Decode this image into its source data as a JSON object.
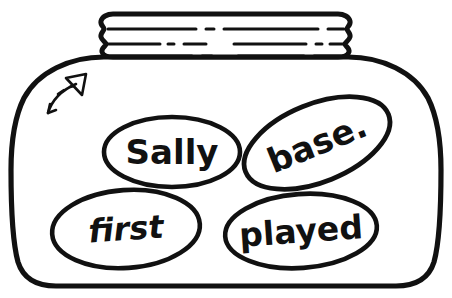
{
  "illustration": {
    "title": "Jar of words",
    "description": "Black and white line drawing of a wide jar with a ridged screw lid containing four oval word bubbles",
    "colors": {
      "ink": "#111111",
      "paper": "#ffffff",
      "fill": "#ffffff"
    }
  },
  "jar": {
    "label": "jar",
    "lid": {
      "label": "jar-lid",
      "ridge_count": 3
    },
    "body": {
      "label": "jar-body"
    }
  },
  "arrow": {
    "label": "hand drawn arrow",
    "direction": "up-right",
    "style": "curved with broken tail"
  },
  "words": [
    {
      "id": "sally",
      "text": "Sally",
      "font_size": 34,
      "italic": false,
      "rotation": 0,
      "cx": 172,
      "cy": 152,
      "rx": 68,
      "ry": 35
    },
    {
      "id": "base",
      "text": "base.",
      "font_size": 34,
      "italic": false,
      "rotation": -22,
      "cx": 317,
      "cy": 143,
      "rx": 77,
      "ry": 39
    },
    {
      "id": "first",
      "text": "first",
      "font_size": 32,
      "italic": true,
      "rotation": -4,
      "cx": 126,
      "cy": 229,
      "rx": 74,
      "ry": 39
    },
    {
      "id": "played",
      "text": "played",
      "font_size": 33,
      "italic": false,
      "rotation": -4,
      "cx": 301,
      "cy": 231,
      "rx": 76,
      "ry": 37
    }
  ]
}
